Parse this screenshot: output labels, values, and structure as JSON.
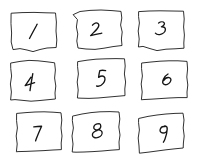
{
  "canvas": {
    "title": "Hand-drawn 3x3 numbered grid",
    "width": 200,
    "height": 168,
    "background_color": "#ffffff",
    "ink_color": "#1a1a1a",
    "style": "hand-drawn pen sketch"
  },
  "grid": {
    "rows": 3,
    "columns": 3,
    "total_cells": 9
  },
  "cells": [
    {
      "id": "cell-1",
      "label": "1",
      "row": 1,
      "column": 1,
      "outline_path": "M 11.5 13.2 L 22 12.6 L 34 12.4 L 46 12.8 L 55.5 13.0 L 56.4 22 L 56.0 31 L 56.8 40 L 56.2 47.5 L 47 48.0 L 40 49.5 L 33 51.6 L 27 50.0 L 20 48.6 L 13 49.6 L 11.2 42 L 11.6 33 L 11.0 24 Z",
      "digit_path": "M 29.5 38.5 C 31.5 34.5 34.0 30.0 36.2 26.0 C 36.6 25.2 36.9 24.6 37.2 24.2"
    },
    {
      "id": "cell-2",
      "label": "2",
      "row": 1,
      "column": 2,
      "outline_path": "M 73.5 14.5 L 80 11.5 L 90 10.4 L 101 10.0 L 112 10.6 L 121 11.4 L 121.8 18 L 120.6 25 L 122.2 32 L 121.4 39 L 122.0 45.5 L 113 46.6 L 104 48.2 L 95 49.4 L 86 49.0 L 78 48.0 L 76.8 41 L 77.8 34 L 76.4 27 L 77.4 20 Z",
      "digit_path": "M 92.5 25.2 C 94.0 23.0 96.5 22.3 98.0 23.5 C 99.4 24.7 98.8 26.8 97.0 29.0 C 95.2 31.2 92.4 33.6 90.6 35.6 C 92.8 35.0 96.4 34.2 99.6 33.6 C 100.6 33.4 101.3 33.3 101.8 33.2"
    },
    {
      "id": "cell-3",
      "label": "3",
      "row": 1,
      "column": 3,
      "outline_path": "M 139.0 11.6 L 149 11.0 L 160 10.8 L 172 11.0 L 183.5 11.2 L 184.2 19 L 183.6 27 L 184.4 35 L 183.8 43 L 184.0 48.2 L 175 48.8 L 166 49.2 L 157 50.6 L 150 48.6 L 143 46.4 L 138.4 47.0 L 139.2 39 L 138.2 31 L 139.4 23 L 138.6 17 Z",
      "digit_path": "M 158.6 23.0 C 160.6 21.6 163.2 21.4 164.2 22.8 C 165.1 24.1 163.6 25.8 161.4 26.8 C 163.8 26.6 165.6 27.6 165.4 29.6 C 165.2 32.0 162.6 34.2 159.8 34.6 C 157.8 34.9 156.2 34.2 155.4 33.2"
    },
    {
      "id": "cell-4",
      "label": "4",
      "row": 2,
      "column": 1,
      "outline_path": "M 11.0 63.0 L 20 61.4 L 29 60.4 L 38 60.8 L 47 61.8 L 54.6 62.8 L 55.4 70 L 54.6 78 L 55.8 86 L 55.0 93 L 55.4 99.0 L 47 99.8 L 39 100.6 L 31 101.2 L 23 100.4 L 15 99.6 L 10.6 100.0 L 11.4 92 L 10.4 84 L 11.6 76 L 10.8 69 Z",
      "digit_path": "M 31.0 77.2 C 29.0 80.4 26.6 83.6 25.2 85.6 C 27.8 84.8 31.6 83.6 34.6 82.6 M 32.8 73.6 C 32.0 78.2 31.0 83.8 30.4 87.8 C 30.2 89.2 30.1 90.0 30.0 90.6"
    },
    {
      "id": "cell-5",
      "label": "5",
      "row": 2,
      "column": 2,
      "outline_path": "M 78.0 61.6 L 87 60.2 L 96 59.2 L 106 58.8 L 116 58.6 L 124.5 58.8 L 125.2 66 L 124.4 74 L 125.6 82 L 124.8 89 L 125.0 95.6 L 116 96.4 L 107 97.2 L 98 98.0 L 89 98.4 L 81 98.2 L 77.4 98.0 L 78.2 90 L 77.2 82 L 78.4 74 L 77.6 67 Z",
      "digit_path": "M 105.6 70.6 C 103.6 70.2 101.4 70.2 99.8 70.6 C 99.2 73.0 98.8 75.4 98.6 77.4 C 100.4 76.2 102.6 75.6 104.0 76.6 C 105.6 77.8 105.2 81.0 103.2 83.4 C 101.4 85.6 98.6 86.6 96.6 86.0"
    },
    {
      "id": "cell-6",
      "label": "6",
      "row": 2,
      "column": 3,
      "outline_path": "M 142.0 63.0 L 151 62.0 L 160 61.2 L 169 60.8 L 178 60.8 L 187.0 61.4 L 187.6 69 L 186.8 77 L 187.8 85 L 187.0 92 L 187.2 97.6 L 178 97.6 L 169 98.0 L 160 98.6 L 151 99.2 L 143 99.6 L 141.4 99.8 L 142.2 92 L 141.2 84 L 142.4 76 L 141.6 69 Z",
      "digit_path": "M 168.0 74.0 C 166.2 75.0 164.4 77.0 163.4 79.2 C 162.4 81.4 162.6 83.6 164.2 84.4 C 166.0 85.3 168.8 84.2 170.2 82.0 C 171.5 80.0 171.0 78.0 169.2 77.6 C 167.2 77.2 164.8 78.6 163.6 80.6"
    },
    {
      "id": "cell-7",
      "label": "7",
      "row": 3,
      "column": 1,
      "outline_path": "M 17.0 113.4 L 26 112.6 L 35 112.0 L 44 111.8 L 53 112.2 L 61.0 112.8 L 61.8 120 L 61.0 128 L 62.0 136 L 61.2 143 L 61.4 149.6 L 53 150.0 L 44 150.6 L 35 151.0 L 26 151.4 L 18 151.6 L 16.4 151.8 L 17.2 144 L 16.2 136 L 17.4 128 L 16.6 121 Z",
      "digit_path": "M 33.8 126.8 C 36.4 126.4 39.4 126.2 41.6 126.2 C 39.8 130.2 37.8 134.8 36.6 138.0 C 36.1 139.3 35.8 140.2 35.6 140.9"
    },
    {
      "id": "cell-8",
      "label": "8",
      "row": 3,
      "column": 2,
      "outline_path": "M 73.0 116.0 L 82 114.0 L 91 112.6 L 100 111.8 L 110 111.6 L 119.0 112.0 L 119.8 119 L 118.8 127 L 120.0 135 L 119.0 142 L 119.4 149.6 L 111 150.2 L 102 151.0 L 93 151.6 L 84 152.0 L 76 152.2 L 72.2 152.0 L 73.0 144 L 72.0 136 L 73.4 128 L 72.4 121 Z",
      "digit_path": "M 99.2 123.6 C 96.4 123.6 94.2 125.0 93.8 127.0 C 93.4 128.9 95.2 130.2 97.6 130.4 C 94.6 131.2 92.2 133.0 92.4 135.2 C 92.6 137.4 95.4 138.4 98.2 137.4 C 101.0 136.4 102.6 134.0 102.0 132.0 C 101.4 130.1 98.8 129.4 96.4 130.2 C 98.8 129.6 100.8 128.0 100.8 126.2 C 100.8 124.6 100.2 123.8 99.2 123.6 Z"
    },
    {
      "id": "cell-9",
      "label": "9",
      "row": 3,
      "column": 3,
      "outline_path": "M 139.0 118.4 L 148 116.4 L 157 115.0 L 166 114.0 L 175 113.4 L 183.0 113.2 L 184.0 120 L 183.2 128 L 184.2 136 L 183.4 143 L 183.2 148.0 L 175 148.8 L 166 149.8 L 157 151.0 L 148 152.2 L 141 153.0 L 139.4 153.2 L 139.0 146 L 138.2 138 L 139.4 130 L 138.6 123 Z",
      "digit_path": "M 165.0 126.6 C 162.8 126.2 160.8 127.4 160.2 129.4 C 159.6 131.4 160.8 133.0 163.0 133.0 C 165.2 133.0 167.0 131.4 167.2 129.2 C 167.4 127.2 166.4 126.0 165.0 125.8 M 167.2 129.2 C 167.0 132.6 166.0 136.4 165.0 139.0 C 164.4 140.6 163.8 141.6 163.4 142.2"
    }
  ]
}
